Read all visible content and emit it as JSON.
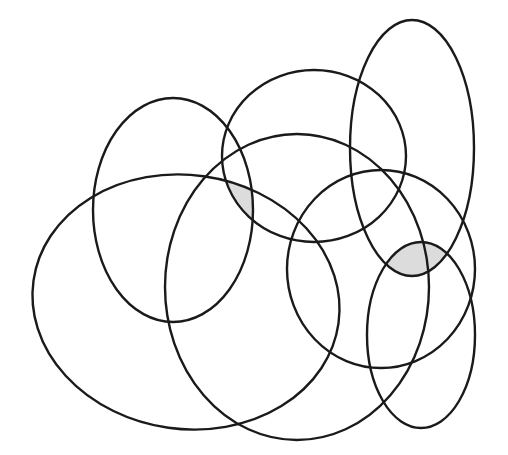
{
  "diagram": {
    "type": "overlapping-ellipses",
    "stroke_color": "#1a1a1a",
    "shade_color": "#dcdcdc",
    "background": "#ffffff",
    "ellipses": [
      {
        "id": "upper-left",
        "cx": 173,
        "cy": 210,
        "rx": 80,
        "ry": 112,
        "rotate": 0
      },
      {
        "id": "top-middle",
        "cx": 314,
        "cy": 156,
        "rx": 92,
        "ry": 86,
        "rotate": 0
      },
      {
        "id": "tall-right",
        "cx": 412,
        "cy": 148,
        "rx": 62,
        "ry": 128,
        "rotate": 0
      },
      {
        "id": "large-left",
        "cx": 186,
        "cy": 302,
        "rx": 154,
        "ry": 127,
        "rotate": 8
      },
      {
        "id": "large-center",
        "cx": 297,
        "cy": 287,
        "rx": 132,
        "ry": 153,
        "rotate": 0
      },
      {
        "id": "right-middle",
        "cx": 381,
        "cy": 269,
        "rx": 94,
        "ry": 99,
        "rotate": 0
      },
      {
        "id": "lower-right",
        "cx": 421,
        "cy": 335,
        "rx": 54,
        "ry": 93,
        "rotate": 0
      }
    ],
    "shaded_regions": [
      {
        "id": "region-a",
        "intersection_of": [
          "upper-left",
          "top-middle",
          "large-left"
        ]
      },
      {
        "id": "region-b",
        "intersection_of": [
          "tall-right",
          "lower-right",
          "right-middle"
        ]
      }
    ]
  }
}
